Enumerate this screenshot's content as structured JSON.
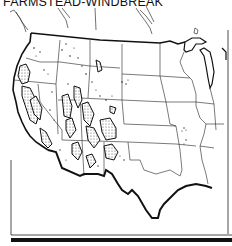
{
  "figure": {
    "title": "FARMSTEAD-WINDBREAK",
    "map_region": "Conterminous United States (western and central)",
    "colors": {
      "ink": "#111111",
      "boundary": "#1a1a1a",
      "paper": "#ffffff",
      "pattern_fill": "#8a8a8a"
    }
  }
}
